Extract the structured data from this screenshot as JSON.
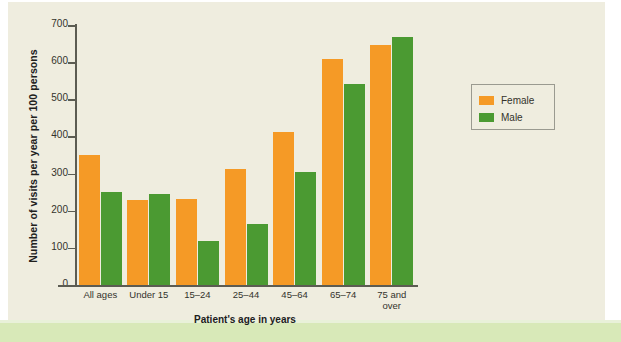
{
  "chart_data": {
    "type": "bar",
    "title": "",
    "xlabel": "Patient's age in years",
    "ylabel": "Number of visits per year per 100 persons",
    "categories": [
      "All ages",
      "Under 15",
      "15–24",
      "25–44",
      "45–64",
      "65–74",
      "75 and over"
    ],
    "series": [
      {
        "name": "Female",
        "color": "#f59a26",
        "values": [
          350,
          230,
          232,
          313,
          413,
          608,
          645
        ]
      },
      {
        "name": "Male",
        "color": "#4b9a32",
        "values": [
          250,
          244,
          118,
          165,
          303,
          540,
          668
        ]
      }
    ],
    "ylim": [
      0,
      700
    ],
    "yticks": [
      0,
      100,
      200,
      300,
      400,
      500,
      600,
      700
    ],
    "ytick_labels": [
      "0",
      "100",
      "200",
      "300",
      "400",
      "500",
      "600",
      "700"
    ],
    "grid": false,
    "legend_position": "right"
  },
  "legend": {
    "entries": [
      {
        "label": "Female",
        "color": "#f59a26"
      },
      {
        "label": "Male",
        "color": "#4b9a32"
      }
    ]
  },
  "colors": {
    "female": "#f59a26",
    "male": "#4b9a32",
    "plate": "#efeddf",
    "band": "#d8e9b8",
    "axis": "#5c5c52"
  }
}
